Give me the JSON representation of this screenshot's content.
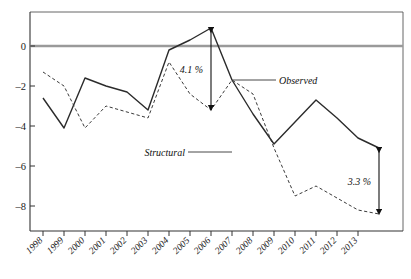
{
  "chart_data": {
    "type": "line",
    "title": "",
    "subtitle": "",
    "xlabel": "",
    "ylabel": "",
    "ylim": [
      -9.4,
      1.7
    ],
    "xlim": [
      1998,
      2014
    ],
    "yticks": [
      0,
      -2,
      -4,
      -6,
      -8
    ],
    "ytick_labels": [
      "0",
      "–2",
      "–4",
      "–6",
      "–8"
    ],
    "grid": false,
    "zero_line": true,
    "zero_line_color": "#9a9a9a",
    "legend_position": "inline-annotations",
    "categories": [
      1998,
      1999,
      2000,
      2001,
      2002,
      2003,
      2004,
      2005,
      2006,
      2007,
      2008,
      2009,
      2010,
      2011,
      2012,
      2013,
      2014
    ],
    "xtick_labels": [
      "1998",
      "1999",
      "2000",
      "2001",
      "2002",
      "2003",
      "2004",
      "2005",
      "2006",
      "2007",
      "2008",
      "2009",
      "2010",
      "2011",
      "2012",
      "2013"
    ],
    "series": [
      {
        "name": "Observed",
        "style": "solid",
        "color": "#2b2b2b",
        "values": [
          -2.6,
          -4.1,
          -1.6,
          -2.0,
          -2.3,
          -3.2,
          -0.2,
          0.3,
          0.9,
          -1.7,
          -3.4,
          -4.9,
          -3.8,
          -2.7,
          -3.6,
          -4.6,
          -5.1
        ]
      },
      {
        "name": "Structural",
        "style": "dashed",
        "color": "#3a3a3a",
        "values": [
          -1.3,
          -2.0,
          -4.1,
          -3.0,
          -3.3,
          -3.6,
          -0.8,
          -2.4,
          -3.2,
          -1.7,
          -2.4,
          -5.1,
          -7.5,
          -7.0,
          -7.6,
          -8.2,
          -8.4
        ]
      }
    ],
    "annotations": [
      {
        "id": "gap-2006",
        "label": "4.1 %",
        "kind": "double-arrow-vertical",
        "x": 2006,
        "y_top": 0.9,
        "y_bottom": -3.2,
        "label_side": "left"
      },
      {
        "id": "gap-2014",
        "label": "3.3 %",
        "kind": "double-arrow-vertical",
        "x": 2014,
        "y_top": -5.1,
        "y_bottom": -8.4,
        "label_side": "left"
      },
      {
        "id": "observed-callout",
        "label": "Observed",
        "kind": "leader-line",
        "anchor_x": 2007,
        "anchor_y": -1.7
      },
      {
        "id": "structural-callout",
        "label": "Structural",
        "kind": "leader-line",
        "anchor_x": 2007,
        "anchor_y": -5.3
      }
    ]
  }
}
